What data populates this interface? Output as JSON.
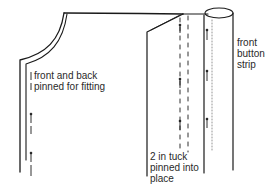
{
  "diagram": {
    "stroke_color": "#1a1a1a",
    "text_color": "#2a2a2a",
    "labels": {
      "front_back": {
        "lines": [
          "front and back",
          "pinned for fitting"
        ]
      },
      "button_strip": {
        "lines": [
          "front",
          "button",
          "strip"
        ]
      },
      "tuck": {
        "lines": [
          "2 in tuck",
          "pinned into",
          "place"
        ]
      }
    }
  }
}
